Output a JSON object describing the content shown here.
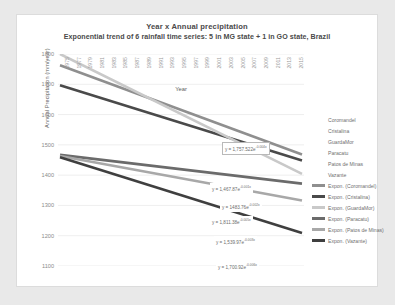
{
  "chart_data": {
    "type": "line",
    "title": "Year x Annual precipitation",
    "subtitle": "Exponential trend of 6 rainfall time series: 5 in MG state + 1 in GO state, Brazil",
    "xlabel": "Year",
    "ylabel": "Annual Precipitation (mm/year)",
    "ylim": [
      1100,
      1800
    ],
    "ytick_step": 100,
    "yticks": [
      "1800",
      "1700",
      "1600",
      "1500",
      "1400",
      "1300",
      "1200",
      "1100"
    ],
    "xlim": [
      1975,
      2015
    ],
    "xticks": [
      "1975",
      "1977",
      "1979",
      "1981",
      "1983",
      "1985",
      "1987",
      "1989",
      "1991",
      "1993",
      "1995",
      "1997",
      "1999",
      "2001",
      "2003",
      "2005",
      "2007",
      "2009",
      "2011",
      "2013",
      "2015"
    ],
    "grid": true,
    "legend_position": "right",
    "series": [
      {
        "name": "Coromandel",
        "equation_label": "y = 1,757.522e",
        "equation_exp": "-0.004x",
        "color": "#8f8f8f",
        "start_value": 1763,
        "end_value": 1468,
        "width": 2.6,
        "boxed_label": false
      },
      {
        "name": "Cristalina",
        "equation_label": "y = 1,467.87e",
        "equation_exp": "-0.001x",
        "color": "#4a4a4a",
        "start_value": 1697,
        "end_value": 1448,
        "width": 2.6,
        "boxed_label": false
      },
      {
        "name": "GuardaMor",
        "equation_label": "y = 1483.76e",
        "equation_exp": "-0.002x",
        "color": "#c9c9c9",
        "start_value": 1800,
        "end_value": 1404,
        "width": 2.6,
        "boxed_label": true
      },
      {
        "name": "Paracatu",
        "equation_label": "y = 1,811.38e",
        "equation_exp": "-0.005x",
        "color": "#6b6b6b",
        "start_value": 1467,
        "end_value": 1372,
        "width": 2.6,
        "boxed_label": false
      },
      {
        "name": "Patos de Minas",
        "equation_label": "y = 1,539.97e",
        "equation_exp": "-0.003x",
        "color": "#a8a8a8",
        "start_value": 1463,
        "end_value": 1316,
        "width": 2.6,
        "boxed_label": false
      },
      {
        "name": "Vazante",
        "equation_label": "y = 1,700.92e",
        "equation_exp": "-0.006x",
        "color": "#3f3f3f",
        "start_value": 1459,
        "end_value": 1209,
        "width": 2.6,
        "boxed_label": false
      }
    ]
  },
  "legend": {
    "series_entries": [
      {
        "label": "Coromandel",
        "swatch": false
      },
      {
        "label": "Cristalina",
        "swatch": false
      },
      {
        "label": "GuardaMor",
        "swatch": false
      },
      {
        "label": "Paracatu",
        "swatch": false
      },
      {
        "label": "Patos de Minas",
        "swatch": false
      },
      {
        "label": "Vazante",
        "swatch": false
      }
    ],
    "trend_entries": [
      {
        "label": "Expon. (Coromandel)",
        "color": "#8f8f8f"
      },
      {
        "label": "Expon. (Cristalina)",
        "color": "#4a4a4a"
      },
      {
        "label": "Expon. (GuardaMor)",
        "color": "#c9c9c9"
      },
      {
        "label": "Expon. (Paracatu)",
        "color": "#6b6b6b"
      },
      {
        "label": "Expon. (Patos de Minas)",
        "color": "#a8a8a8"
      },
      {
        "label": "Expon. (Vazante)",
        "color": "#3f3f3f"
      }
    ]
  }
}
